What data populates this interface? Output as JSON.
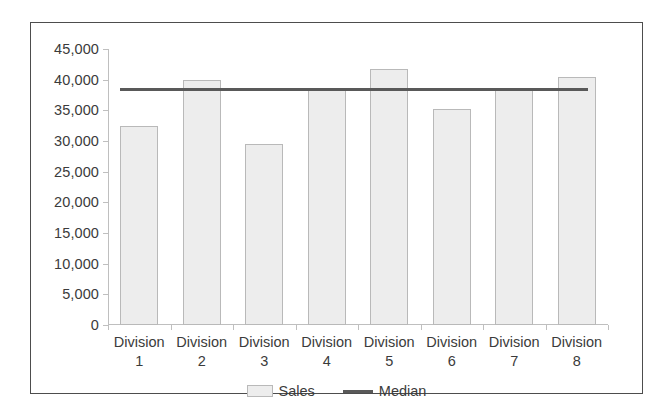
{
  "chart_data": {
    "type": "bar",
    "title": "",
    "subtitle": "",
    "xlabel": "",
    "ylabel": "",
    "categories": [
      "Division 1",
      "Division 2",
      "Division 3",
      "Division 4",
      "Division 5",
      "Division 6",
      "Division 7",
      "Division 8"
    ],
    "category_lines": [
      [
        "Division",
        "1"
      ],
      [
        "Division",
        "2"
      ],
      [
        "Division",
        "3"
      ],
      [
        "Division",
        "4"
      ],
      [
        "Division",
        "5"
      ],
      [
        "Division",
        "6"
      ],
      [
        "Division",
        "7"
      ],
      [
        "Division",
        "8"
      ]
    ],
    "series": [
      {
        "name": "Sales",
        "type": "bar",
        "color": "#ededed",
        "border_color": "#b9b9b9",
        "values": [
          32500,
          40000,
          29500,
          38500,
          41800,
          35200,
          38500,
          40500
        ]
      },
      {
        "name": "Median",
        "type": "line",
        "color": "#595959",
        "value": 38500
      }
    ],
    "ylim": [
      0,
      45000
    ],
    "ytick_values": [
      0,
      5000,
      10000,
      15000,
      20000,
      25000,
      30000,
      35000,
      40000,
      45000
    ],
    "ytick_labels": [
      "0",
      "5,000",
      "10,000",
      "15,000",
      "20,000",
      "25,000",
      "30,000",
      "35,000",
      "40,000",
      "45,000"
    ],
    "grid": false,
    "legend_position": "bottom",
    "legend_entries": [
      {
        "label": "Sales",
        "marker": "box",
        "color": "#ededed"
      },
      {
        "label": "Median",
        "marker": "line",
        "color": "#595959"
      }
    ]
  },
  "frame": {
    "border_color": "#4d4d4d",
    "background": "#ffffff"
  }
}
